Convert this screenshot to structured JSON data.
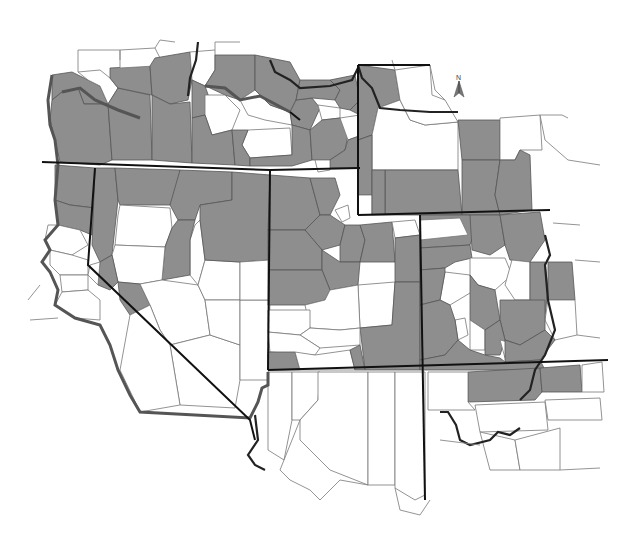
{
  "map": {
    "type": "choropleth",
    "region": "Western United States (county level)",
    "legend": null,
    "north_arrow": {
      "label": "N",
      "position": [
        458,
        82
      ]
    },
    "colors": {
      "shaded_county": "#8e8e8e",
      "unshaded_county": "#ffffff",
      "state_boundary": "#111111",
      "county_boundary": "#666666",
      "background": "#ffffff"
    },
    "classes": [
      {
        "name": "shaded",
        "color": "#8e8e8e"
      },
      {
        "name": "unshaded",
        "color": "#ffffff"
      }
    ]
  }
}
